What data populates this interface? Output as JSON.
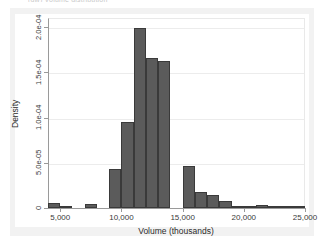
{
  "clipped_title_text": "(dw) Volume distribution",
  "chart_data": {
    "type": "bar",
    "subtype": "histogram",
    "title": "",
    "xlabel": "Volume (thousands)",
    "ylabel": "Density",
    "xlim": [
      4000,
      25000
    ],
    "ylim": [
      0,
      0.00021
    ],
    "bin_width": 1000,
    "grid": true,
    "legend": false,
    "legend_position": "none",
    "bar_color": "#5b5b5b",
    "bar_edge_color": "#3a3a3a",
    "plot_background": "#ffffff",
    "figure_background": "#f2f2f2",
    "xticks": [
      5000,
      10000,
      15000,
      20000,
      25000
    ],
    "xticklabels": [
      "5,000",
      "10,000",
      "15,000",
      "20,000",
      "25,000"
    ],
    "yticks": [
      0,
      5e-05,
      0.0001,
      0.00015,
      0.0002
    ],
    "yticklabels": [
      "0",
      "5.0e-05",
      "1.0e-04",
      "1.5e-04",
      "2.0e-04"
    ],
    "bin_edges": [
      4000,
      5000,
      6000,
      7000,
      8000,
      9000,
      10000,
      11000,
      12000,
      13000,
      14000,
      15000,
      16000,
      17000,
      18000,
      19000,
      20000,
      21000,
      22000,
      23000,
      24000,
      25000
    ],
    "categories": [
      "4,000–5,000",
      "5,000–6,000",
      "6,000–7,000",
      "7,000–8,000",
      "8,000–9,000",
      "9,000–10,000",
      "10,000–11,000",
      "11,000–12,000",
      "12,000–13,000",
      "13,000–14,000",
      "14,000–15,000",
      "15,000–16,000",
      "16,000–17,000",
      "17,000–18,000",
      "18,000–19,000",
      "19,000–20,000",
      "20,000–21,000",
      "21,000–22,000",
      "22,000–23,000",
      "23,000–24,000",
      "24,000–25,000"
    ],
    "values": [
      5.5e-06,
      2e-06,
      0.0,
      4.5e-06,
      0.0,
      4.3e-05,
      9.5e-05,
      0.000199,
      0.000166,
      0.000163,
      0.0,
      4.6e-05,
      1.8e-05,
      1.4e-05,
      7.5e-06,
      2e-06,
      1e-06,
      3e-06,
      8e-07,
      6e-07,
      6e-07
    ]
  }
}
